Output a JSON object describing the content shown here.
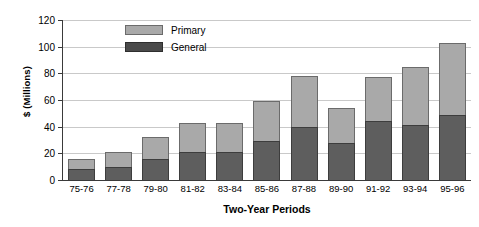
{
  "chart_data": {
    "type": "bar",
    "subtype": "stacked-vertical",
    "title": "",
    "xlabel": "Two-Year Periods",
    "ylabel": "$ (Millions)",
    "ylim": [
      0,
      120
    ],
    "ytick_step": 20,
    "yticks": [
      "120",
      "100",
      "80",
      "60",
      "40",
      "20",
      "0"
    ],
    "ytick_values": [
      120,
      100,
      80,
      60,
      40,
      20,
      0
    ],
    "grid": "horizontal",
    "legend_position": "top-left-inside",
    "categories": [
      "75-76",
      "77-78",
      "79-80",
      "81-82",
      "83-84",
      "85-86",
      "87-88",
      "89-90",
      "91-92",
      "93-94",
      "95-96"
    ],
    "series": [
      {
        "name": "General",
        "color": "#5e5e5e",
        "values": [
          8,
          10,
          16,
          21,
          21,
          29,
          40,
          28,
          44,
          41,
          49
        ]
      },
      {
        "name": "Primary",
        "color": "#a9a9a9",
        "values": [
          8,
          11,
          16,
          22,
          22,
          30,
          38,
          26,
          33,
          44,
          54
        ]
      }
    ],
    "totals": [
      16,
      21,
      32,
      43,
      43,
      59,
      78,
      54,
      77,
      85,
      103
    ]
  },
  "legend": {
    "items": [
      {
        "label": "Primary",
        "swatch": "primary"
      },
      {
        "label": "General",
        "swatch": "general"
      }
    ]
  },
  "colors": {
    "primary": "#a9a9a9",
    "general": "#5e5e5e",
    "gridline": "#c9c9c9",
    "axis": "#3a3a3a",
    "background": "#ffffff",
    "text": "#000000"
  }
}
